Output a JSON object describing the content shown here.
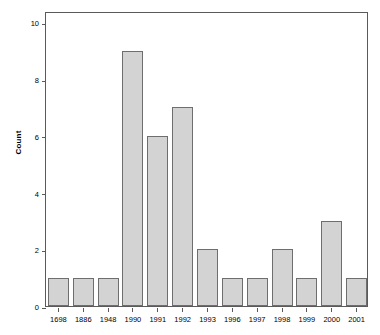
{
  "chart_data": {
    "type": "bar",
    "title": "",
    "xlabel": "",
    "ylabel": "Count",
    "categories": [
      "1698",
      "1886",
      "1948",
      "1990",
      "1991",
      "1992",
      "1993",
      "1996",
      "1997",
      "1998",
      "1999",
      "2000",
      "2001"
    ],
    "values": [
      1,
      1,
      1,
      9,
      6,
      7,
      2,
      1,
      1,
      2,
      1,
      3,
      1
    ],
    "ylim": [
      0,
      10.4
    ],
    "ytick_values": [
      0,
      2,
      4,
      6,
      8,
      10
    ],
    "ytick_labels": [
      "0",
      "2",
      "4",
      "6",
      "8",
      "10"
    ],
    "grid": false,
    "legend": false,
    "bar_fill_color": "#d3d3d3",
    "bar_border_color": "#6e6e6e",
    "axis_color": "#5a5a5a",
    "background_color": "#ffffff"
  }
}
